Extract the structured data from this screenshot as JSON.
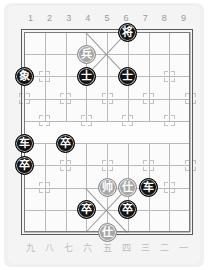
{
  "board": {
    "title": "Xiangqi Board",
    "columns": 9,
    "rows": 10,
    "colors": {
      "page_background": "#ffffff",
      "paper": "#f0f0f0",
      "board_surface": "#fbfbfb",
      "grid_line": "#b9b9b9",
      "frame": "#5a5a5a",
      "black_piece": "#121212",
      "gray_piece": "#a6a6a6",
      "piece_text": "#ffffff",
      "coord_text": "#9a9a9a",
      "coord_text_cn": "#bdbdbd"
    },
    "river": {
      "present": true,
      "label": ""
    }
  },
  "coords_top": [
    {
      "label": "1"
    },
    {
      "label": "2"
    },
    {
      "label": "3"
    },
    {
      "label": "4"
    },
    {
      "label": "5"
    },
    {
      "label": "6"
    },
    {
      "label": "7"
    },
    {
      "label": "8"
    },
    {
      "label": "9"
    }
  ],
  "coords_bottom": [
    {
      "label": "九"
    },
    {
      "label": "八"
    },
    {
      "label": "七"
    },
    {
      "label": "六"
    },
    {
      "label": "五"
    },
    {
      "label": "四"
    },
    {
      "label": "三"
    },
    {
      "label": "二"
    },
    {
      "label": "一"
    }
  ],
  "pieces": [
    {
      "name": "general-black",
      "label": "将",
      "side": "black",
      "col": 6,
      "row": 0
    },
    {
      "name": "pawn-gray-1",
      "label": "兵",
      "side": "gray",
      "col": 4,
      "row": 1
    },
    {
      "name": "elephant-black",
      "label": "象",
      "side": "black",
      "col": 1,
      "row": 2
    },
    {
      "name": "advisor-black-1",
      "label": "士",
      "side": "black",
      "col": 4,
      "row": 2
    },
    {
      "name": "advisor-black-2",
      "label": "士",
      "side": "black",
      "col": 6,
      "row": 2
    },
    {
      "name": "chariot-black-1",
      "label": "车",
      "side": "black",
      "col": 1,
      "row": 5
    },
    {
      "name": "pawn-black-1",
      "label": "卒",
      "side": "black",
      "col": 3,
      "row": 5
    },
    {
      "name": "pawn-black-2",
      "label": "卒",
      "side": "black",
      "col": 1,
      "row": 6
    },
    {
      "name": "marshal-gray",
      "label": "帅",
      "side": "gray",
      "col": 5,
      "row": 7
    },
    {
      "name": "advisor-gray-1",
      "label": "仕",
      "side": "gray",
      "col": 6,
      "row": 7
    },
    {
      "name": "chariot-black-2",
      "label": "车",
      "side": "black",
      "col": 7,
      "row": 7
    },
    {
      "name": "pawn-black-3",
      "label": "卒",
      "side": "black",
      "col": 4,
      "row": 8
    },
    {
      "name": "pawn-black-4",
      "label": "卒",
      "side": "black",
      "col": 6,
      "row": 8
    },
    {
      "name": "advisor-gray-2",
      "label": "仕",
      "side": "gray",
      "col": 5,
      "row": 9
    }
  ],
  "markers": [
    {
      "col": 2,
      "row": 2
    },
    {
      "col": 8,
      "row": 2
    },
    {
      "col": 3,
      "row": 3
    },
    {
      "col": 5,
      "row": 3
    },
    {
      "col": 7,
      "row": 3
    },
    {
      "col": 1,
      "row": 3
    },
    {
      "col": 9,
      "row": 3
    },
    {
      "col": 2,
      "row": 4
    },
    {
      "col": 4,
      "row": 4
    },
    {
      "col": 6,
      "row": 4
    },
    {
      "col": 8,
      "row": 4
    },
    {
      "col": 3,
      "row": 6
    },
    {
      "col": 5,
      "row": 6
    },
    {
      "col": 7,
      "row": 6
    },
    {
      "col": 1,
      "row": 6
    },
    {
      "col": 9,
      "row": 6
    },
    {
      "col": 2,
      "row": 7
    },
    {
      "col": 8,
      "row": 7
    }
  ]
}
